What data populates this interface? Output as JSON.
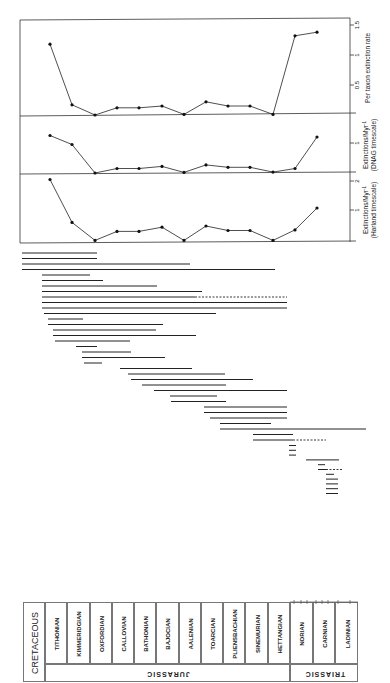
{
  "figure": {
    "panels": [
      {
        "id": "per-taxon",
        "ylabel": "Per taxon extinction rate",
        "ticks": [
          "0.5",
          "1",
          "1.5"
        ]
      },
      {
        "id": "dnag",
        "ylabel_line1": "Extinctions/Myr",
        "ylabel_sup": "-1",
        "ylabel_line2": "(DNAG timescale)",
        "ticks": [
          "1"
        ]
      },
      {
        "id": "harland",
        "ylabel_line1": "Extinctions/Myr",
        "ylabel_sup": "-1",
        "ylabel_line2": "(Harland timescale)",
        "ticks": [
          "1",
          "2"
        ]
      }
    ],
    "stratigraphy": {
      "periods": [
        "CRETACEOUS",
        "JURASSIC",
        "TRIASSIC"
      ],
      "stages": [
        "TITHONIAN",
        "KIMMERIDGIAN",
        "OXFORDIAN",
        "CALLOVIAN",
        "BATHONIAN",
        "BAJOCIAN",
        "AALENIAN",
        "TOARCIAN",
        "PLIENSBACHIAN",
        "SINEMURIAN",
        "HETTANGIAN",
        "NORIAN",
        "CARNIAN",
        "LADINIAN"
      ]
    }
  },
  "chart_data": [
    {
      "type": "line",
      "title": "Per taxon extinction rate",
      "categories": [
        "Tithonian",
        "Kimmeridgian",
        "Oxfordian",
        "Callovian",
        "Bathonian",
        "Bajocian",
        "Aalenian",
        "Toarcian",
        "Pliensbachian",
        "Sinemurian",
        "Hettangian",
        "Norian",
        "Carnian"
      ],
      "values": [
        1.18,
        0.17,
        0.0,
        0.12,
        0.12,
        0.15,
        0.01,
        0.22,
        0.15,
        0.15,
        0.01,
        1.32,
        1.38
      ],
      "ylabel": "Per taxon extinction rate",
      "ylim": [
        0,
        1.5
      ],
      "yticks": [
        0.5,
        1,
        1.5
      ],
      "grid": false
    },
    {
      "type": "line",
      "title": "Extinctions/Myr-1 (DNAG timescale)",
      "categories": [
        "Tithonian",
        "Kimmeridgian",
        "Oxfordian",
        "Callovian",
        "Bathonian",
        "Bajocian",
        "Aalenian",
        "Toarcian",
        "Pliensbachian",
        "Sinemurian",
        "Hettangian",
        "Norian",
        "Carnian"
      ],
      "values": [
        1.25,
        0.95,
        0.0,
        0.15,
        0.15,
        0.22,
        0.02,
        0.27,
        0.19,
        0.19,
        0.03,
        0.15,
        1.2
      ],
      "ylabel": "Extinctions/Myr-1 (DNAG timescale)",
      "ylim": [
        0,
        1.5
      ],
      "yticks": [
        1
      ],
      "grid": false
    },
    {
      "type": "line",
      "title": "Extinctions/Myr-1 (Harland timescale)",
      "categories": [
        "Tithonian",
        "Kimmeridgian",
        "Oxfordian",
        "Callovian",
        "Bathonian",
        "Bajocian",
        "Aalenian",
        "Toarcian",
        "Pliensbachian",
        "Sinemurian",
        "Hettangian",
        "Norian",
        "Carnian"
      ],
      "values": [
        2.05,
        0.62,
        0.02,
        0.32,
        0.32,
        0.46,
        0.02,
        0.5,
        0.35,
        0.35,
        0.02,
        0.37,
        1.1
      ],
      "ylabel": "Extinctions/Myr-1 (Harland timescale)",
      "ylim": [
        0,
        2.1
      ],
      "yticks": [
        1,
        2
      ],
      "grid": false
    },
    {
      "type": "range",
      "title": "Stratigraphic ranges of taxa",
      "ranges": [
        {
          "start": 22,
          "end": 97
        },
        {
          "start": 22,
          "end": 97
        },
        {
          "start": 22,
          "end": 190
        },
        {
          "start": 22,
          "end": 275
        },
        {
          "start": 42,
          "end": 90
        },
        {
          "start": 42,
          "end": 103
        },
        {
          "start": 42,
          "end": 157
        },
        {
          "start": 42,
          "end": 202
        },
        {
          "start": 42,
          "end": 287,
          "dashed_from": 195
        },
        {
          "start": 42,
          "end": 287
        },
        {
          "start": 42,
          "end": 287
        },
        {
          "start": 44,
          "end": 216
        },
        {
          "start": 48,
          "end": 83
        },
        {
          "start": 48,
          "end": 163
        },
        {
          "start": 53,
          "end": 156
        },
        {
          "start": 53,
          "end": 196
        },
        {
          "start": 55,
          "end": 130
        },
        {
          "start": 76,
          "end": 97
        },
        {
          "start": 82,
          "end": 131
        },
        {
          "start": 82,
          "end": 165
        },
        {
          "start": 84,
          "end": 102
        },
        {
          "start": 120,
          "end": 192
        },
        {
          "start": 128,
          "end": 225
        },
        {
          "start": 131,
          "end": 253
        },
        {
          "start": 142,
          "end": 226
        },
        {
          "start": 154,
          "end": 287
        },
        {
          "start": 170,
          "end": 217
        },
        {
          "start": 171,
          "end": 226
        },
        {
          "start": 204,
          "end": 287
        },
        {
          "start": 204,
          "end": 287
        },
        {
          "start": 210,
          "end": 287
        },
        {
          "start": 220,
          "end": 271
        },
        {
          "start": 220,
          "end": 366
        },
        {
          "start": 253,
          "end": 293
        },
        {
          "start": 253,
          "end": 326,
          "dashed_from": 293
        },
        {
          "start": 289,
          "end": 296
        },
        {
          "start": 289,
          "end": 296
        },
        {
          "start": 289,
          "end": 296
        },
        {
          "start": 306,
          "end": 339
        },
        {
          "start": 318,
          "end": 325
        },
        {
          "start": 318,
          "end": 343,
          "dashed_from": 326
        },
        {
          "start": 326,
          "end": 334
        },
        {
          "start": 326,
          "end": 338
        },
        {
          "start": 326,
          "end": 338
        },
        {
          "start": 326,
          "end": 338
        },
        {
          "start": 326,
          "end": 338
        }
      ]
    }
  ]
}
